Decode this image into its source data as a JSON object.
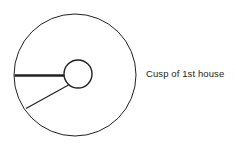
{
  "figure": {
    "background_color": "#ffffff",
    "stroke_color": "#231f20",
    "text_color": "#231f20",
    "width": 236,
    "height": 150
  },
  "labels": {
    "cusp_first_house": "Cusp of 1st house"
  },
  "chart_data": {
    "type": "diagram",
    "title": "Cusp of 1st house",
    "subtitle": "",
    "xlabel": "",
    "ylabel": "",
    "grid": false,
    "legend": "none",
    "elements": [
      {
        "name": "outer-circle",
        "shape": "circle",
        "cx": 75,
        "cy": 75,
        "r": 61,
        "stroke": "#231f20",
        "stroke_width": 1,
        "fill": "none"
      },
      {
        "name": "inner-circle",
        "shape": "circle",
        "cx": 78,
        "cy": 74,
        "r": 14,
        "stroke": "#231f20",
        "stroke_width": 1.4,
        "fill": "none"
      },
      {
        "name": "cusp-first-house-line",
        "shape": "line",
        "x1": 14.5,
        "y1": 75.5,
        "x2": 64,
        "y2": 75.5,
        "stroke": "#231f20",
        "stroke_width": 2.6,
        "emphasis": "bold"
      },
      {
        "name": "house-divider-line",
        "shape": "line",
        "x1": 68.5,
        "y1": 85,
        "x2": 26,
        "y2": 108.5,
        "stroke": "#231f20",
        "stroke_width": 1.2,
        "emphasis": "normal"
      }
    ],
    "annotations": [
      {
        "name": "cusp-first-house-label",
        "text": "Cusp of 1st house",
        "x": 146,
        "y": 75,
        "anchor": "start",
        "font_size": 9.5,
        "color": "#231f20"
      }
    ]
  }
}
